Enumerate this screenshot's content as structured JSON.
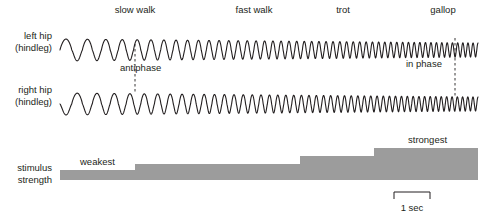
{
  "figure": {
    "title_present": false,
    "background": "#ffffff",
    "ink_color": "#231f20",
    "bar_color": "#9c9c9c",
    "width": 487,
    "height": 224
  },
  "gait_labels": [
    {
      "text": "slow walk",
      "x": 135,
      "y": 4
    },
    {
      "text": "fast walk",
      "x": 254,
      "y": 4
    },
    {
      "text": "trot",
      "x": 343,
      "y": 4
    },
    {
      "text": "gallop",
      "x": 443,
      "y": 4
    }
  ],
  "row_labels": [
    {
      "line1": "left hip",
      "line2": "(hindleg)",
      "x": 52,
      "y": 30
    },
    {
      "line1": "right hip",
      "line2": "(hindleg)",
      "x": 52,
      "y": 84
    },
    {
      "line1": "stimulus",
      "line2": "strength",
      "x": 52,
      "y": 162
    }
  ],
  "annotations": [
    {
      "text": "antiphase",
      "x": 120,
      "y": 62
    },
    {
      "text": "in phase",
      "x": 406,
      "y": 58
    },
    {
      "text": "weakest",
      "x": 80,
      "y": 156
    },
    {
      "text": "strongest",
      "x": 408,
      "y": 134
    }
  ],
  "phase_markers": [
    {
      "name": "antiphase-marker",
      "x": 135,
      "y1": 44,
      "y2": 92
    },
    {
      "name": "in-phase-marker",
      "x": 455,
      "y1": 38,
      "y2": 98
    }
  ],
  "scale_bar": {
    "label": "1 sec",
    "x_start": 394,
    "x_end": 430,
    "y_top": 192,
    "tick_height": 7,
    "label_x": 412,
    "label_y": 203
  },
  "chart_data": {
    "type": "line",
    "title": "",
    "xlabel": "",
    "ylabel": "",
    "x_axis": {
      "units": "seconds",
      "scale_bar_seconds": 1,
      "scale_bar_pixels": 36,
      "trace_start_px": 60,
      "trace_end_px": 478,
      "grid": false
    },
    "series": [
      {
        "name": "left hip (hindleg)",
        "baseline_y_px": 50,
        "amplitude_px_start": 11,
        "amplitude_px_end": 7,
        "phase_offset_cycles": 0.0,
        "cycles_per_second_start": 1.45,
        "cycles_per_second_end": 7.2
      },
      {
        "name": "right hip (hindleg)",
        "baseline_y_px": 104,
        "amplitude_px_start": 11,
        "amplitude_px_end": 7,
        "phase_offset_cycles_start": 0.5,
        "phase_offset_cycles_end": 0.0,
        "cycles_per_second_start": 1.45,
        "cycles_per_second_end": 7.2
      }
    ],
    "stimulus_steps": [
      {
        "gait": "slow walk",
        "x_start": 60,
        "x_end": 135,
        "level": 1,
        "label": "weakest",
        "height_px": 10
      },
      {
        "gait": "fast walk",
        "x_start": 135,
        "x_end": 300,
        "level": 2,
        "label": "",
        "height_px": 16
      },
      {
        "gait": "trot",
        "x_start": 300,
        "x_end": 374,
        "level": 3,
        "label": "",
        "height_px": 24
      },
      {
        "gait": "gallop",
        "x_start": 374,
        "x_end": 478,
        "level": 4,
        "label": "strongest",
        "height_px": 32
      }
    ],
    "stimulus_baseline_y_px": 180,
    "legend": [],
    "legend_position": "none"
  }
}
